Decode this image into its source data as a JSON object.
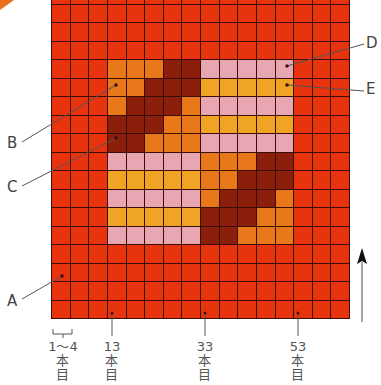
{
  "colors": {
    "background_red": "#e8330f",
    "orange": "#e8781a",
    "maroon": "#8c1e0c",
    "pink": "#e8a5b2",
    "yellow": "#f0a423",
    "grid_line": "#3a0e06"
  },
  "grid": {
    "cols": 16,
    "rows": 18,
    "motif_origin": {
      "col": 3,
      "row": 4
    },
    "motif": [
      [
        "O",
        "O",
        "O",
        "M",
        "M",
        "P",
        "P",
        "P",
        "P",
        "P"
      ],
      [
        "O",
        "O",
        "M",
        "M",
        "M",
        "Y",
        "Y",
        "Y",
        "Y",
        "Y"
      ],
      [
        "O",
        "M",
        "M",
        "M",
        "O",
        "P",
        "P",
        "P",
        "P",
        "P"
      ],
      [
        "M",
        "M",
        "M",
        "O",
        "O",
        "Y",
        "Y",
        "Y",
        "Y",
        "Y"
      ],
      [
        "M",
        "M",
        "O",
        "O",
        "O",
        "P",
        "P",
        "P",
        "P",
        "P"
      ],
      [
        "P",
        "P",
        "P",
        "P",
        "P",
        "O",
        "O",
        "O",
        "M",
        "M"
      ],
      [
        "Y",
        "Y",
        "Y",
        "Y",
        "Y",
        "O",
        "O",
        "M",
        "M",
        "M"
      ],
      [
        "P",
        "P",
        "P",
        "P",
        "P",
        "O",
        "M",
        "M",
        "M",
        "O"
      ],
      [
        "Y",
        "Y",
        "Y",
        "Y",
        "Y",
        "M",
        "M",
        "M",
        "O",
        "O"
      ],
      [
        "P",
        "P",
        "P",
        "P",
        "P",
        "M",
        "M",
        "O",
        "O",
        "O"
      ]
    ]
  },
  "callouts": {
    "A": "A",
    "B": "B",
    "C": "C",
    "D": "D",
    "E": "E"
  },
  "bottom_labels": [
    {
      "number": "1〜4",
      "l1": "本",
      "l2": "目"
    },
    {
      "number": "13",
      "l1": "本",
      "l2": "目"
    },
    {
      "number": "33",
      "l1": "本",
      "l2": "目"
    },
    {
      "number": "53",
      "l1": "本",
      "l2": "目"
    }
  ],
  "direction_arrow": "up"
}
